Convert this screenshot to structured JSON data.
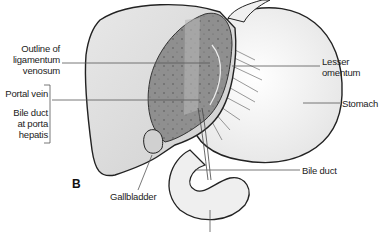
{
  "figure": {
    "panel_label": "B",
    "labels": {
      "outline_ligamentum": [
        "Outline of",
        "ligamentum",
        "venosum"
      ],
      "portal_vein": "Portal vein",
      "bile_duct_porta": [
        "Bile duct",
        "at porta",
        "hepatis"
      ],
      "lesser_omentum": [
        "Lesser",
        "omentum"
      ],
      "stomach": "Stomach",
      "bile_duct": "Bile duct",
      "gallbladder": "Gallbladder"
    },
    "colors": {
      "liver": "#dcdcdc",
      "cut_surface": "#8f8f8f",
      "stomach": "#f2f2f2",
      "outline": "#222222",
      "leader": "#555555"
    }
  }
}
